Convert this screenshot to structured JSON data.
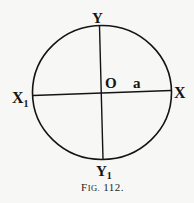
{
  "figure": {
    "caption": "Fig. 112.",
    "caption_prefix": "F",
    "caption_smallcaps": "IG.",
    "caption_number": "112."
  },
  "labels": {
    "top": "Y",
    "bottom": "Y",
    "bottom_sub": "1",
    "left": "X",
    "left_sub": "1",
    "right": "X",
    "center": "O",
    "radius": "a"
  },
  "geometry": {
    "circle": {
      "cx": 102,
      "cy": 92.5,
      "rx": 69.5,
      "ry": 67
    },
    "vertical_axis": {
      "x1": 99.5,
      "y1": 26,
      "x2": 103,
      "y2": 159
    },
    "horizontal_axis": {
      "x1": 33,
      "y1": 95.5,
      "x2": 171,
      "y2": 90.5
    },
    "stroke_color": "#141414"
  }
}
